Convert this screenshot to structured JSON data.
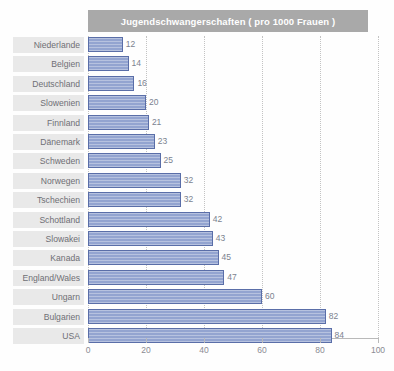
{
  "chart_data": {
    "type": "bar",
    "orientation": "horizontal",
    "title": "Jugendschwangerschaften ( pro 1000 Frauen )",
    "xlabel": "",
    "ylabel": "",
    "xlim": [
      0,
      100
    ],
    "xticks": [
      0,
      20,
      40,
      60,
      80,
      100
    ],
    "xtick_labels": [
      "0",
      "20",
      "40",
      "60",
      "80",
      "100"
    ],
    "grid": true,
    "grid_axis": "x",
    "legend": false,
    "categories": [
      "Niederlande",
      "Belgien",
      "Deutschland",
      "Slowenien",
      "Finnland",
      "Dänemark",
      "Schweden",
      "Norwegen",
      "Tschechien",
      "Schottland",
      "Slowakei",
      "Kanada",
      "England/Wales",
      "Ungarn",
      "Bulgarien",
      "USA"
    ],
    "values": [
      12,
      14,
      16,
      20,
      21,
      23,
      25,
      32,
      32,
      42,
      43,
      45,
      47,
      60,
      82,
      84
    ],
    "value_labels": [
      "12",
      "14",
      "16",
      "20",
      "21",
      "23",
      "25",
      "32",
      "32",
      "42",
      "43",
      "45",
      "47",
      "60",
      "82",
      "84"
    ],
    "colors": {
      "bar_fill": "#93a4d0",
      "bar_border": "#5a6ea8",
      "title_band": "#a9a9a9",
      "title_text": "#ffffff",
      "label_band": "#e9e9e9",
      "label_text": "#6f6f75",
      "value_text": "#7b828f",
      "gridline": "#c3c3c3",
      "axis": "#b9b9b9",
      "background": "#fefefe"
    }
  }
}
